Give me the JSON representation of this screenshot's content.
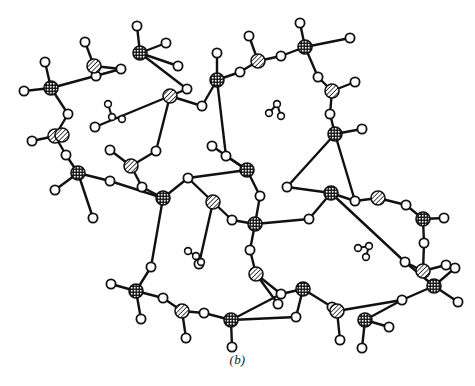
{
  "figure": {
    "caption": "(b)",
    "background_color": "#ffffff",
    "line_color": "#111111"
  },
  "legend": {
    "atom_types": [
      {
        "key": "t-atom-crosshatched",
        "label": "T atom (cross-hatched)",
        "fill_pattern": "cross-hatch",
        "radius": 7.0,
        "color": "#111111"
      },
      {
        "key": "t-atom-diagonal",
        "label": "T atom (diagonal hatched)",
        "fill_pattern": "diagonal-hatch",
        "radius": 7.0,
        "color": "#111111"
      },
      {
        "key": "oxygen",
        "label": "Oxygen / bridging atom (open circle)",
        "fill_pattern": "open",
        "radius": 4.6,
        "color": "#ffffff"
      },
      {
        "key": "guest-molecule",
        "label": "Guest molecule in cavity",
        "fill_pattern": "small-open",
        "radius": 3.4,
        "color": "#ffffff"
      }
    ]
  },
  "chart_data": {
    "type": "scatter",
    "title": "(b)",
    "xlabel": "",
    "ylabel": "",
    "xlim": [
      0,
      475
    ],
    "ylim": [
      0,
      386
    ],
    "grid": false,
    "legend_position": "none",
    "t_atoms_crosshatched": [
      {
        "id": "T1",
        "x": 51,
        "y": 88
      },
      {
        "id": "T2",
        "x": 140,
        "y": 53
      },
      {
        "id": "T3",
        "x": 217,
        "y": 80
      },
      {
        "id": "T4",
        "x": 305,
        "y": 47
      },
      {
        "id": "T5",
        "x": 335,
        "y": 134
      },
      {
        "id": "T6",
        "x": 78,
        "y": 173
      },
      {
        "id": "T7",
        "x": 163,
        "y": 198
      },
      {
        "id": "T8",
        "x": 247,
        "y": 170
      },
      {
        "id": "T9",
        "x": 255,
        "y": 224
      },
      {
        "id": "T10",
        "x": 331,
        "y": 193
      },
      {
        "id": "T11",
        "x": 423,
        "y": 219
      },
      {
        "id": "T12",
        "x": 136,
        "y": 291
      },
      {
        "id": "T13",
        "x": 231,
        "y": 320
      },
      {
        "id": "T14",
        "x": 303,
        "y": 289
      },
      {
        "id": "T15",
        "x": 365,
        "y": 320
      },
      {
        "id": "T16",
        "x": 434,
        "y": 286
      }
    ],
    "t_atoms_diagonal": [
      {
        "id": "D1",
        "x": 94,
        "y": 66
      },
      {
        "id": "D2",
        "x": 170,
        "y": 96
      },
      {
        "id": "D3",
        "x": 258,
        "y": 61
      },
      {
        "id": "D4",
        "x": 332,
        "y": 91
      },
      {
        "id": "D5",
        "x": 55,
        "y": 136
      },
      {
        "id": "D6",
        "x": 131,
        "y": 166
      },
      {
        "id": "D7",
        "x": 213,
        "y": 202
      },
      {
        "id": "D8",
        "x": 378,
        "y": 198
      },
      {
        "id": "D9",
        "x": 256,
        "y": 274
      },
      {
        "id": "D10",
        "x": 423,
        "y": 271
      },
      {
        "id": "D11",
        "x": 182,
        "y": 311
      },
      {
        "id": "D12",
        "x": 337,
        "y": 311
      },
      {
        "id": "D13",
        "x": 62,
        "y": 135
      }
    ],
    "oxygen_bridges": [
      {
        "id": "O1",
        "x": 96,
        "y": 76
      },
      {
        "id": "O2",
        "x": 121,
        "y": 69
      },
      {
        "id": "O3",
        "x": 178,
        "y": 66
      },
      {
        "id": "O4",
        "x": 187,
        "y": 89
      },
      {
        "id": "O5",
        "x": 202,
        "y": 106
      },
      {
        "id": "O6",
        "x": 240,
        "y": 72
      },
      {
        "id": "O7",
        "x": 281,
        "y": 56
      },
      {
        "id": "O8",
        "x": 318,
        "y": 77
      },
      {
        "id": "O9",
        "x": 330,
        "y": 114
      },
      {
        "id": "O10",
        "x": 68,
        "y": 114
      },
      {
        "id": "O11",
        "x": 66,
        "y": 155
      },
      {
        "id": "O12",
        "x": 110,
        "y": 181
      },
      {
        "id": "O13",
        "x": 142,
        "y": 187
      },
      {
        "id": "O14",
        "x": 156,
        "y": 151
      },
      {
        "id": "O15",
        "x": 188,
        "y": 178
      },
      {
        "id": "O16",
        "x": 226,
        "y": 156
      },
      {
        "id": "O17",
        "x": 260,
        "y": 196
      },
      {
        "id": "O18",
        "x": 232,
        "y": 220
      },
      {
        "id": "O19",
        "x": 287,
        "y": 187
      },
      {
        "id": "O20",
        "x": 309,
        "y": 219
      },
      {
        "id": "O21",
        "x": 355,
        "y": 201
      },
      {
        "id": "O22",
        "x": 406,
        "y": 205
      },
      {
        "id": "O23",
        "x": 424,
        "y": 243
      },
      {
        "id": "O24",
        "x": 250,
        "y": 250
      },
      {
        "id": "O25",
        "x": 151,
        "y": 267
      },
      {
        "id": "O26",
        "x": 163,
        "y": 298
      },
      {
        "id": "O27",
        "x": 204,
        "y": 313
      },
      {
        "id": "O28",
        "x": 281,
        "y": 294
      },
      {
        "id": "O29",
        "x": 332,
        "y": 307
      },
      {
        "id": "O30",
        "x": 402,
        "y": 300
      },
      {
        "id": "O31",
        "x": 405,
        "y": 262
      }
    ],
    "terminal_oxygens": [
      {
        "id": "X1",
        "x": 45,
        "y": 62
      },
      {
        "id": "X2",
        "x": 24,
        "y": 91
      },
      {
        "id": "X3",
        "x": 85,
        "y": 42
      },
      {
        "id": "X4",
        "x": 137,
        "y": 26
      },
      {
        "id": "X5",
        "x": 166,
        "y": 43
      },
      {
        "id": "X6",
        "x": 217,
        "y": 53
      },
      {
        "id": "X7",
        "x": 249,
        "y": 36
      },
      {
        "id": "X8",
        "x": 300,
        "y": 23
      },
      {
        "id": "X9",
        "x": 350,
        "y": 38
      },
      {
        "id": "X10",
        "x": 355,
        "y": 82
      },
      {
        "id": "X11",
        "x": 362,
        "y": 129
      },
      {
        "id": "X12",
        "x": 32,
        "y": 141
      },
      {
        "id": "X13",
        "x": 55,
        "y": 190
      },
      {
        "id": "X14",
        "x": 93,
        "y": 218
      },
      {
        "id": "X15",
        "x": 110,
        "y": 150
      },
      {
        "id": "X16",
        "x": 212,
        "y": 146
      },
      {
        "id": "X17",
        "x": 444,
        "y": 218
      },
      {
        "id": "X18",
        "x": 446,
        "y": 265
      },
      {
        "id": "X19",
        "x": 111,
        "y": 284
      },
      {
        "id": "X20",
        "x": 141,
        "y": 319
      },
      {
        "id": "X21",
        "x": 186,
        "y": 338
      },
      {
        "id": "X22",
        "x": 232,
        "y": 347
      },
      {
        "id": "X23",
        "x": 296,
        "y": 317
      },
      {
        "id": "X24",
        "x": 340,
        "y": 340
      },
      {
        "id": "X25",
        "x": 389,
        "y": 327
      },
      {
        "id": "X26",
        "x": 362,
        "y": 348
      },
      {
        "id": "X27",
        "x": 458,
        "y": 302
      },
      {
        "id": "X28",
        "x": 455,
        "y": 268
      },
      {
        "id": "X29",
        "x": 95,
        "y": 127
      },
      {
        "id": "X30",
        "x": 278,
        "y": 304
      },
      {
        "id": "X31",
        "x": 199,
        "y": 264
      }
    ],
    "bonds": [
      [
        "T1",
        "X1"
      ],
      [
        "T1",
        "X2"
      ],
      [
        "T1",
        "O10"
      ],
      [
        "T1",
        "O2"
      ],
      [
        "D1",
        "X3"
      ],
      [
        "D1",
        "O1"
      ],
      [
        "D1",
        "O2"
      ],
      [
        "D1",
        "O1"
      ],
      [
        "T2",
        "X4"
      ],
      [
        "T2",
        "X5"
      ],
      [
        "T2",
        "O3"
      ],
      [
        "T2",
        "O4"
      ],
      [
        "D2",
        "O4"
      ],
      [
        "D2",
        "O5"
      ],
      [
        "D2",
        "O14"
      ],
      [
        "D2",
        "X29"
      ],
      [
        "T3",
        "X6"
      ],
      [
        "T3",
        "O5"
      ],
      [
        "T3",
        "O6"
      ],
      [
        "T3",
        "O16"
      ],
      [
        "D3",
        "O6"
      ],
      [
        "D3",
        "X7"
      ],
      [
        "D3",
        "O7"
      ],
      [
        "T4",
        "X8"
      ],
      [
        "T4",
        "O7"
      ],
      [
        "T4",
        "X9"
      ],
      [
        "T4",
        "O8"
      ],
      [
        "D4",
        "O8"
      ],
      [
        "D4",
        "X10"
      ],
      [
        "D4",
        "O9"
      ],
      [
        "T5",
        "O9"
      ],
      [
        "T5",
        "X11"
      ],
      [
        "T5",
        "O19"
      ],
      [
        "T5",
        "O21"
      ],
      [
        "D5",
        "X12"
      ],
      [
        "D5",
        "O10"
      ],
      [
        "D5",
        "O11"
      ],
      [
        "T6",
        "O11"
      ],
      [
        "T6",
        "X13"
      ],
      [
        "T6",
        "X14"
      ],
      [
        "T6",
        "O12"
      ],
      [
        "D6",
        "O14"
      ],
      [
        "D6",
        "O13"
      ],
      [
        "D6",
        "X15"
      ],
      [
        "T7",
        "O13"
      ],
      [
        "T7",
        "O12"
      ],
      [
        "T7",
        "O15"
      ],
      [
        "T7",
        "O25"
      ],
      [
        "T8",
        "X16"
      ],
      [
        "T8",
        "O16"
      ],
      [
        "T8",
        "O15"
      ],
      [
        "T8",
        "O17"
      ],
      [
        "D7",
        "O15"
      ],
      [
        "D7",
        "O18"
      ],
      [
        "D7",
        "X31"
      ],
      [
        "T9",
        "O17"
      ],
      [
        "T9",
        "O18"
      ],
      [
        "T9",
        "O20"
      ],
      [
        "T9",
        "O24"
      ],
      [
        "T10",
        "O19"
      ],
      [
        "T10",
        "O20"
      ],
      [
        "T10",
        "O21"
      ],
      [
        "T10",
        "O31"
      ],
      [
        "D8",
        "O21"
      ],
      [
        "D8",
        "O22"
      ],
      [
        "T11",
        "O22"
      ],
      [
        "T11",
        "X17"
      ],
      [
        "T11",
        "O23"
      ],
      [
        "D10",
        "O23"
      ],
      [
        "D10",
        "X18"
      ],
      [
        "D10",
        "O31"
      ],
      [
        "D9",
        "O24"
      ],
      [
        "D9",
        "X30"
      ],
      [
        "D9",
        "O28"
      ],
      [
        "T12",
        "O25"
      ],
      [
        "T12",
        "X19"
      ],
      [
        "T12",
        "X20"
      ],
      [
        "T12",
        "O26"
      ],
      [
        "D11",
        "O26"
      ],
      [
        "D11",
        "X21"
      ],
      [
        "D11",
        "O27"
      ],
      [
        "T13",
        "O27"
      ],
      [
        "T13",
        "X22"
      ],
      [
        "T13",
        "X23"
      ],
      [
        "T13",
        "O28"
      ],
      [
        "T14",
        "O28"
      ],
      [
        "T14",
        "O29"
      ],
      [
        "T14",
        "X23"
      ],
      [
        "D12",
        "O29"
      ],
      [
        "D12",
        "X24"
      ],
      [
        "D12",
        "O30"
      ],
      [
        "T15",
        "O30"
      ],
      [
        "T15",
        "X25"
      ],
      [
        "T15",
        "X26"
      ],
      [
        "T16",
        "O30"
      ],
      [
        "T16",
        "X27"
      ],
      [
        "T16",
        "X28"
      ],
      [
        "T16",
        "O31"
      ]
    ],
    "cavities": [
      {
        "id": "cavity-upper-left",
        "center_x": 113,
        "center_y": 113,
        "guest_molecule": {
          "atoms": [
            {
              "x": 108,
              "y": 104,
              "r": 3.4
            },
            {
              "x": 112,
              "y": 117,
              "r": 3.4
            },
            {
              "x": 122,
              "y": 119,
              "r": 3.4
            }
          ],
          "bonds": [
            [
              0,
              1
            ],
            [
              1,
              2
            ]
          ]
        }
      },
      {
        "id": "cavity-upper-right",
        "center_x": 274,
        "center_y": 109,
        "guest_molecule": {
          "atoms": [
            {
              "x": 269,
              "y": 113,
              "r": 3.4
            },
            {
              "x": 277,
              "y": 104,
              "r": 3.4
            },
            {
              "x": 281,
              "y": 116,
              "r": 3.4
            }
          ],
          "bonds": [
            [
              0,
              1
            ],
            [
              1,
              2
            ]
          ]
        }
      },
      {
        "id": "cavity-lower-left",
        "center_x": 193,
        "center_y": 255,
        "guest_molecule": {
          "atoms": [
            {
              "x": 188,
              "y": 251,
              "r": 3.4
            },
            {
              "x": 196,
              "y": 256,
              "r": 3.4
            },
            {
              "x": 201,
              "y": 262,
              "r": 3.4
            }
          ],
          "bonds": [
            [
              0,
              1
            ],
            [
              1,
              2
            ]
          ]
        }
      },
      {
        "id": "cavity-lower-right",
        "center_x": 366,
        "center_y": 250,
        "guest_molecule": {
          "atoms": [
            {
              "x": 358,
              "y": 248,
              "r": 3.4
            },
            {
              "x": 369,
              "y": 246,
              "r": 3.4
            },
            {
              "x": 366,
              "y": 257,
              "r": 3.4
            }
          ],
          "bonds": [
            [
              0,
              1
            ],
            [
              1,
              2
            ]
          ]
        }
      }
    ]
  }
}
